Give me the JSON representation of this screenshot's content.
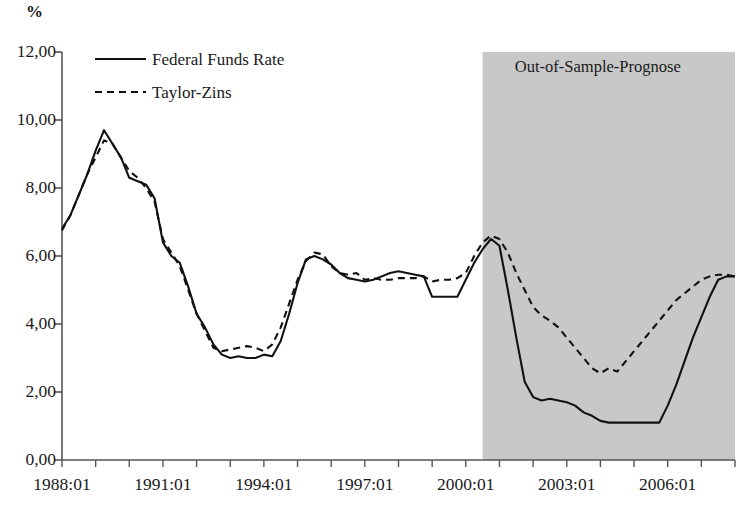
{
  "chart_data": {
    "type": "line",
    "title": "",
    "ylabel": "%",
    "xlabel": "",
    "ylim": [
      0,
      12
    ],
    "ytick_labels": [
      "12,00",
      "10,00",
      "8,00",
      "6,00",
      "4,00",
      "2,00",
      "0,00"
    ],
    "ytick_values": [
      12,
      10,
      8,
      6,
      4,
      2,
      0
    ],
    "xtick_labels": [
      "1988:01",
      "1991:01",
      "1994:01",
      "1997:01",
      "2000:01",
      "2003:01",
      "2006:01"
    ],
    "xtick_values": [
      1988,
      1991,
      1994,
      1997,
      2000,
      2003,
      2006
    ],
    "xlim": [
      1988,
      2008
    ],
    "grid": false,
    "legend_position": "top-left",
    "annotations": [
      {
        "name": "out-of-sample-region",
        "label": "Out-of-Sample-Prognose",
        "x_start": 2000.5,
        "x_end": 2008.0,
        "fill": "#c8c8c8"
      }
    ],
    "series": [
      {
        "name": "Federal Funds Rate",
        "style": "solid",
        "color": "#111111",
        "x": [
          1988.0,
          1988.25,
          1988.5,
          1988.75,
          1989.0,
          1989.25,
          1989.5,
          1989.75,
          1990.0,
          1990.25,
          1990.5,
          1990.75,
          1991.0,
          1991.25,
          1991.5,
          1991.75,
          1992.0,
          1992.25,
          1992.5,
          1992.75,
          1993.0,
          1993.25,
          1993.5,
          1993.75,
          1994.0,
          1994.25,
          1994.5,
          1994.75,
          1995.0,
          1995.25,
          1995.5,
          1995.75,
          1996.0,
          1996.25,
          1996.5,
          1996.75,
          1997.0,
          1997.25,
          1997.5,
          1997.75,
          1998.0,
          1998.25,
          1998.5,
          1998.75,
          1999.0,
          1999.25,
          1999.5,
          1999.75,
          2000.0,
          2000.25,
          2000.5,
          2000.75,
          2001.0,
          2001.25,
          2001.5,
          2001.75,
          2002.0,
          2002.25,
          2002.5,
          2002.75,
          2003.0,
          2003.25,
          2003.5,
          2003.75,
          2004.0,
          2004.25,
          2004.5,
          2004.75,
          2005.0,
          2005.25,
          2005.5,
          2005.75,
          2006.0,
          2006.25,
          2006.5,
          2006.75,
          2007.0,
          2007.25,
          2007.5,
          2007.75
        ],
        "y": [
          6.8,
          7.2,
          7.8,
          8.4,
          9.1,
          9.7,
          9.3,
          8.9,
          8.3,
          8.2,
          8.1,
          7.7,
          6.4,
          6.0,
          5.8,
          5.1,
          4.3,
          3.9,
          3.4,
          3.1,
          3.0,
          3.05,
          3.0,
          3.0,
          3.1,
          3.05,
          3.5,
          4.3,
          5.2,
          5.9,
          6.0,
          5.9,
          5.75,
          5.5,
          5.35,
          5.3,
          5.25,
          5.3,
          5.4,
          5.5,
          5.55,
          5.5,
          5.45,
          5.4,
          4.8,
          4.8,
          4.8,
          4.8,
          5.3,
          5.8,
          6.2,
          6.5,
          6.3,
          5.0,
          3.6,
          2.3,
          1.85,
          1.75,
          1.8,
          1.75,
          1.7,
          1.6,
          1.4,
          1.3,
          1.15,
          1.1,
          1.1,
          1.1,
          1.1,
          1.1,
          1.1,
          1.1,
          1.6,
          2.2,
          2.9,
          3.6,
          4.2,
          4.8,
          5.3,
          5.4
        ],
        "y_tail": [
          5.4,
          5.4,
          5.45,
          5.4,
          4.3
        ]
      },
      {
        "name": "Taylor-Zins",
        "style": "dashed",
        "color": "#111111",
        "x": [
          1988.0,
          1988.25,
          1988.5,
          1988.75,
          1989.0,
          1989.25,
          1989.5,
          1989.75,
          1990.0,
          1990.25,
          1990.5,
          1990.75,
          1991.0,
          1991.25,
          1991.5,
          1991.75,
          1992.0,
          1992.25,
          1992.5,
          1992.75,
          1993.0,
          1993.25,
          1993.5,
          1993.75,
          1994.0,
          1994.25,
          1994.5,
          1994.75,
          1995.0,
          1995.25,
          1995.5,
          1995.75,
          1996.0,
          1996.25,
          1996.5,
          1996.75,
          1997.0,
          1997.25,
          1997.5,
          1997.75,
          1998.0,
          1998.25,
          1998.5,
          1998.75,
          1999.0,
          1999.25,
          1999.5,
          1999.75,
          2000.0,
          2000.25,
          2000.5,
          2000.75,
          2001.0,
          2001.25,
          2001.5,
          2001.75,
          2002.0,
          2002.25,
          2002.5,
          2002.75,
          2003.0,
          2003.25,
          2003.5,
          2003.75,
          2004.0,
          2004.25,
          2004.5,
          2004.75,
          2005.0,
          2005.25,
          2005.5,
          2005.75,
          2006.0,
          2006.25,
          2006.5,
          2006.75,
          2007.0,
          2007.25,
          2007.5,
          2007.75
        ],
        "y": [
          6.75,
          7.2,
          7.8,
          8.4,
          8.9,
          9.4,
          9.3,
          8.9,
          8.5,
          8.3,
          8.0,
          7.6,
          6.5,
          6.1,
          5.7,
          5.0,
          4.3,
          3.8,
          3.3,
          3.2,
          3.25,
          3.3,
          3.35,
          3.3,
          3.2,
          3.4,
          3.9,
          4.6,
          5.3,
          5.85,
          6.1,
          6.05,
          5.7,
          5.5,
          5.45,
          5.5,
          5.3,
          5.35,
          5.3,
          5.3,
          5.35,
          5.35,
          5.35,
          5.4,
          5.25,
          5.3,
          5.3,
          5.35,
          5.5,
          6.0,
          6.4,
          6.6,
          6.5,
          6.1,
          5.5,
          5.0,
          4.5,
          4.25,
          4.1,
          3.9,
          3.6,
          3.3,
          3.0,
          2.7,
          2.55,
          2.7,
          2.6,
          2.9,
          3.2,
          3.5,
          3.8,
          4.1,
          4.4,
          4.7,
          4.9,
          5.1,
          5.3,
          5.4,
          5.45,
          5.45
        ],
        "y_tail": [
          5.4,
          5.5,
          5.35,
          5.1,
          4.9
        ]
      }
    ]
  },
  "legend": {
    "items": [
      {
        "label": "Federal Funds Rate",
        "style": "solid"
      },
      {
        "label": "Taylor-Zins",
        "style": "dashed"
      }
    ]
  },
  "axis": {
    "y_unit": "%",
    "axis_color": "#555555"
  }
}
